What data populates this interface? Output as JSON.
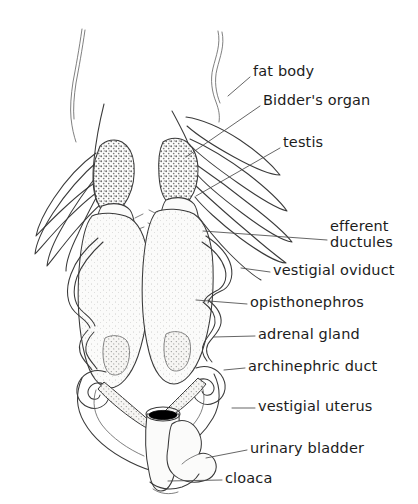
{
  "figure": {
    "background_color": "#ffffff",
    "ink_color": "#3a3a3a",
    "leader_color": "#4a4a4a",
    "accent_black": "#000000"
  },
  "labels": [
    {
      "id": "fat-body",
      "text": "fat body",
      "x": 253,
      "y": 63,
      "leader": "M 250 77 L 228 96"
    },
    {
      "id": "bidders-organ",
      "text": "Bidder's organ",
      "x": 263,
      "y": 92,
      "leader": "M 260 106 L 186 157"
    },
    {
      "id": "testis",
      "text": "testis",
      "x": 283,
      "y": 134,
      "leader": "M 280 148 L 196 196"
    },
    {
      "id": "efferent-ductules",
      "text": "efferent\nductules",
      "x": 330,
      "y": 218,
      "leader": "M 327 240 L 203 231"
    },
    {
      "id": "vestigial-oviduct",
      "text": "vestigial oviduct",
      "x": 273,
      "y": 262,
      "leader": "M 270 272 L 241 268"
    },
    {
      "id": "opisthonephros",
      "text": "opisthonephros",
      "x": 250,
      "y": 294,
      "leader": "M 247 304 L 196 300"
    },
    {
      "id": "adrenal-gland",
      "text": "adrenal gland",
      "x": 258,
      "y": 326,
      "leader": "M 255 336 L 214 337"
    },
    {
      "id": "archinephric-duct",
      "text": "archinephric duct",
      "x": 248,
      "y": 358,
      "leader": "M 245 368 L 224 370"
    },
    {
      "id": "vestigial-uterus",
      "text": "vestigial uterus",
      "x": 258,
      "y": 398,
      "leader": "M 255 408 L 232 408"
    },
    {
      "id": "urinary-bladder",
      "text": "urinary bladder",
      "x": 250,
      "y": 440,
      "leader": "M 247 450 L 206 458"
    },
    {
      "id": "cloaca",
      "text": "cloaca",
      "x": 225,
      "y": 470,
      "leader": "M 222 480 L 168 481"
    }
  ]
}
